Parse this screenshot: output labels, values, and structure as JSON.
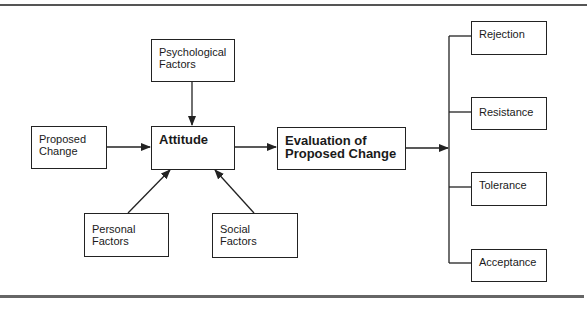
{
  "diagram": {
    "type": "flowchart",
    "nodes": {
      "psychological": {
        "label_1": "Psychological",
        "label_2": "Factors"
      },
      "proposed": {
        "label_1": "Proposed",
        "label_2": "Change"
      },
      "attitude": {
        "label": "Attitude"
      },
      "evaluation": {
        "label_1": "Evaluation of",
        "label_2": "Proposed Change"
      },
      "personal": {
        "label_1": "Personal",
        "label_2": "Factors"
      },
      "social": {
        "label_1": "Social",
        "label_2": "Factors"
      },
      "rejection": {
        "label": "Rejection"
      },
      "resistance": {
        "label": "Resistance"
      },
      "tolerance": {
        "label": "Tolerance"
      },
      "acceptance": {
        "label": "Acceptance"
      }
    },
    "edges": [
      {
        "from": "Psychological Factors",
        "to": "Attitude"
      },
      {
        "from": "Proposed Change",
        "to": "Attitude"
      },
      {
        "from": "Personal Factors",
        "to": "Attitude"
      },
      {
        "from": "Social Factors",
        "to": "Attitude"
      },
      {
        "from": "Attitude",
        "to": "Evaluation of Proposed Change"
      },
      {
        "from": "Evaluation of Proposed Change",
        "to": [
          "Rejection",
          "Resistance",
          "Tolerance",
          "Acceptance"
        ]
      }
    ],
    "colors": {
      "line": "#222222",
      "rule": "#555555",
      "background": "#ffffff"
    }
  }
}
